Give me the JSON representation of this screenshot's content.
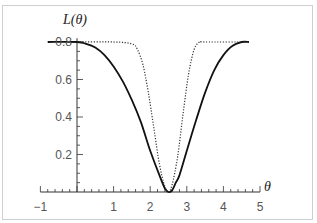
{
  "chart_data": {
    "type": "line",
    "title": "",
    "xlabel": "θ",
    "ylabel": "L(θ)",
    "xlim": [
      -1,
      5
    ],
    "ylim": [
      0,
      0.85
    ],
    "grid": false,
    "legend": null,
    "x_ticks": [
      -1,
      1,
      2,
      3,
      4,
      5
    ],
    "x_tick_labels": [
      "−1",
      "1",
      "2",
      "3",
      "4",
      "5"
    ],
    "y_ticks": [
      0.2,
      0.4,
      0.6,
      0.8
    ],
    "y_tick_labels": [
      "0.2",
      "0.4",
      "0.6",
      "0.8"
    ],
    "series": [
      {
        "name": "solid",
        "style": "solid",
        "color": "#111111",
        "x": [
          -0.8,
          0.0,
          0.25,
          0.5,
          0.75,
          1.0,
          1.25,
          1.5,
          1.75,
          2.0,
          2.25,
          2.4,
          2.5,
          2.6,
          2.7,
          2.8,
          3.0,
          3.25,
          3.5,
          3.75,
          4.0,
          4.25,
          4.5,
          4.7
        ],
        "y": [
          0.8,
          0.8,
          0.79,
          0.77,
          0.73,
          0.67,
          0.59,
          0.49,
          0.37,
          0.22,
          0.09,
          0.02,
          0.0,
          0.01,
          0.05,
          0.09,
          0.22,
          0.38,
          0.53,
          0.65,
          0.73,
          0.78,
          0.8,
          0.8
        ]
      },
      {
        "name": "dotted",
        "style": "dotted",
        "color": "#333333",
        "x": [
          0.0,
          1.0,
          1.5,
          1.65,
          1.8,
          1.95,
          2.1,
          2.25,
          2.4,
          2.5,
          2.6,
          2.75,
          2.9,
          3.05,
          3.2,
          3.35,
          3.5,
          4.7
        ],
        "y": [
          0.8,
          0.8,
          0.79,
          0.76,
          0.68,
          0.53,
          0.34,
          0.15,
          0.03,
          0.0,
          0.04,
          0.19,
          0.42,
          0.63,
          0.76,
          0.8,
          0.8,
          0.8
        ]
      }
    ]
  }
}
